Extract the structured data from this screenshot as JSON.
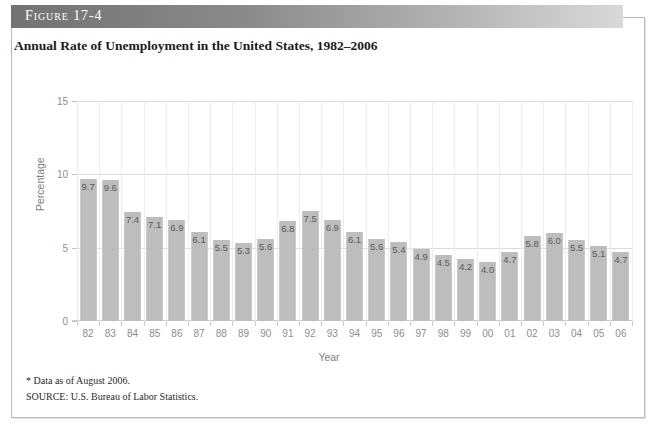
{
  "figure": {
    "number_label": "Figure 17-4",
    "title": "Annual Rate of Unemployment in the United States, 1982–2006",
    "footnote": "* Data as of August 2006.",
    "source": "SOURCE: U.S. Bureau of Labor Statistics."
  },
  "colors": {
    "bar_fill": "#bdbdbd",
    "bar_edge": "#c9c9c9",
    "header_dark": "#727272",
    "header_light": "#d9d9d9",
    "grid": "#dcdcdc",
    "tick_text": "#8d8d8d",
    "value_text": "#595959"
  },
  "chart_data": {
    "type": "bar",
    "title": "Annual Rate of Unemployment in the United States, 1982–2006",
    "xlabel": "Year",
    "ylabel": "Percentage",
    "ylim": [
      0,
      15
    ],
    "yticks": [
      0,
      5,
      10,
      15
    ],
    "ytick_labels": [
      "0",
      "5",
      "10",
      "15"
    ],
    "grid": true,
    "legend": false,
    "categories": [
      "82",
      "83",
      "84",
      "85",
      "86",
      "87",
      "88",
      "89",
      "90",
      "91",
      "92",
      "93",
      "94",
      "95",
      "96",
      "97",
      "98",
      "99",
      "00",
      "01",
      "02",
      "03",
      "04",
      "05",
      "06"
    ],
    "values": [
      9.7,
      9.6,
      7.4,
      7.1,
      6.9,
      6.1,
      5.5,
      5.3,
      5.6,
      6.8,
      7.5,
      6.9,
      6.1,
      5.6,
      5.4,
      4.9,
      4.5,
      4.2,
      4.0,
      4.7,
      5.8,
      6.0,
      5.5,
      5.1,
      4.7
    ],
    "value_labels": [
      "9.7",
      "9.6",
      "7.4",
      "7.1",
      "6.9",
      "6.1",
      "5.5",
      "5.3",
      "5.6",
      "6.8",
      "7.5",
      "6.9",
      "6.1",
      "5.6",
      "5.4",
      "4.9",
      "4.5",
      "4.2",
      "4.0",
      "4.7",
      "5.8",
      "6.0",
      "5.5",
      "5.1",
      "4.7"
    ],
    "annotations": [
      "* Data as of August 2006.",
      "SOURCE: U.S. Bureau of Labor Statistics."
    ]
  }
}
